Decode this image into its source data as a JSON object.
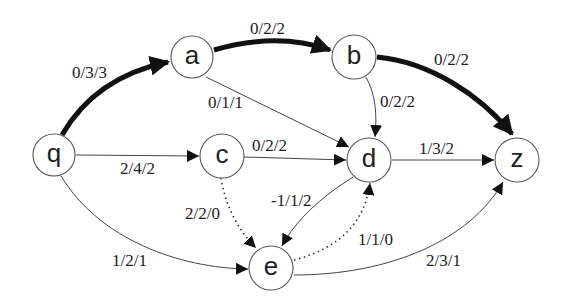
{
  "diagram": {
    "type": "flow-network",
    "nodes": [
      {
        "id": "q",
        "label": "q"
      },
      {
        "id": "a",
        "label": "a"
      },
      {
        "id": "b",
        "label": "b"
      },
      {
        "id": "c",
        "label": "c"
      },
      {
        "id": "d",
        "label": "d"
      },
      {
        "id": "e",
        "label": "e"
      },
      {
        "id": "z",
        "label": "z"
      }
    ],
    "edges": [
      {
        "from": "q",
        "to": "a",
        "label": "0/3/3",
        "style": "thick"
      },
      {
        "from": "a",
        "to": "b",
        "label": "0/2/2",
        "style": "thick"
      },
      {
        "from": "b",
        "to": "z",
        "label": "0/2/2",
        "style": "thick"
      },
      {
        "from": "a",
        "to": "d",
        "label": "0/1/1",
        "style": "thin"
      },
      {
        "from": "b",
        "to": "d",
        "label": "0/2/2",
        "style": "thin"
      },
      {
        "from": "q",
        "to": "c",
        "label": "2/4/2",
        "style": "thin"
      },
      {
        "from": "c",
        "to": "d",
        "label": "0/2/2",
        "style": "thin"
      },
      {
        "from": "d",
        "to": "z",
        "label": "1/3/2",
        "style": "thin"
      },
      {
        "from": "c",
        "to": "e",
        "label": "2/2/0",
        "style": "dotted"
      },
      {
        "from": "d",
        "to": "e",
        "label": "-1/1/2",
        "style": "thin"
      },
      {
        "from": "e",
        "to": "d",
        "label": "1/1/0",
        "style": "dotted"
      },
      {
        "from": "q",
        "to": "e",
        "label": "1/2/1",
        "style": "thin"
      },
      {
        "from": "e",
        "to": "z",
        "label": "2/3/1",
        "style": "thin"
      }
    ]
  }
}
